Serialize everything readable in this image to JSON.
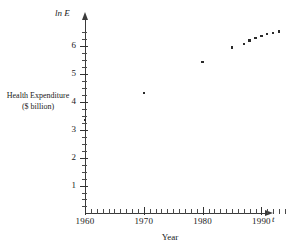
{
  "chart_data": {
    "type": "scatter",
    "title": "",
    "xlabel": "Year",
    "ylabel": "ln E",
    "series_label_line1": "Health Expenditure",
    "series_label_line2": "($ billion)",
    "x_axis_symbol": "t",
    "y_axis_symbol": "ln E",
    "xlim": [
      1959,
      1995
    ],
    "ylim": [
      0,
      6.8
    ],
    "xticks": [
      1960,
      1970,
      1980,
      1990
    ],
    "xtick_labels": [
      "1960",
      "1970",
      "1980",
      "1990"
    ],
    "xtick_minor_step": 1,
    "yticks": [
      1,
      2,
      3,
      4,
      5,
      6
    ],
    "ytick_labels": [
      "1",
      "2",
      "3",
      "4",
      "5",
      "6"
    ],
    "ytick_minor_step": 0.25,
    "grid": false,
    "legend": "none",
    "point_color": "#2a2a2a",
    "axis_color": "#3a3a3a",
    "x": [
      1960,
      1970,
      1980,
      1985,
      1987,
      1988,
      1989,
      1990,
      1991,
      1992,
      1993
    ],
    "y": [
      3.36,
      4.32,
      5.43,
      5.95,
      6.08,
      6.2,
      6.28,
      6.35,
      6.42,
      6.47,
      6.52
    ],
    "points": [
      {
        "x": 1960,
        "y": 3.36
      },
      {
        "x": 1970,
        "y": 4.32
      },
      {
        "x": 1980,
        "y": 5.43
      },
      {
        "x": 1985,
        "y": 5.95
      },
      {
        "x": 1987,
        "y": 6.08
      },
      {
        "x": 1988,
        "y": 6.2
      },
      {
        "x": 1989,
        "y": 6.28
      },
      {
        "x": 1990,
        "y": 6.35
      },
      {
        "x": 1991,
        "y": 6.42
      },
      {
        "x": 1992,
        "y": 6.47
      },
      {
        "x": 1993,
        "y": 6.52
      }
    ]
  }
}
